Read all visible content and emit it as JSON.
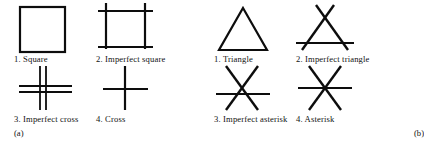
{
  "figure": {
    "background_color": "#ffffff",
    "stroke_color": "#0d0d0d",
    "panels": [
      {
        "tag": "(a)",
        "items": [
          {
            "number": "1.",
            "name": "Square",
            "caption": "1. Square",
            "icon": "square-shape-icon"
          },
          {
            "number": "2.",
            "name": "Imperfect square",
            "caption": "2. Imperfect square",
            "icon": "imperfect-square-shape-icon"
          },
          {
            "number": "3.",
            "name": "Imperfect cross",
            "caption": "3. Imperfect cross",
            "icon": "imperfect-cross-shape-icon"
          },
          {
            "number": "4.",
            "name": "Cross",
            "caption": "4. Cross",
            "icon": "cross-shape-icon"
          }
        ]
      },
      {
        "tag": "(b)",
        "items": [
          {
            "number": "1.",
            "name": "Triangle",
            "caption": "1. Triangle",
            "icon": "triangle-shape-icon"
          },
          {
            "number": "2.",
            "name": "Imperfect triangle",
            "caption": "2. Imperfect triangle",
            "icon": "imperfect-triangle-shape-icon"
          },
          {
            "number": "3.",
            "name": "Imperfect asterisk",
            "caption": "3. Imperfect asterisk",
            "icon": "imperfect-asterisk-shape-icon"
          },
          {
            "number": "4.",
            "name": "Asterisk",
            "caption": "4. Asterisk",
            "icon": "asterisk-shape-icon"
          }
        ]
      }
    ]
  }
}
